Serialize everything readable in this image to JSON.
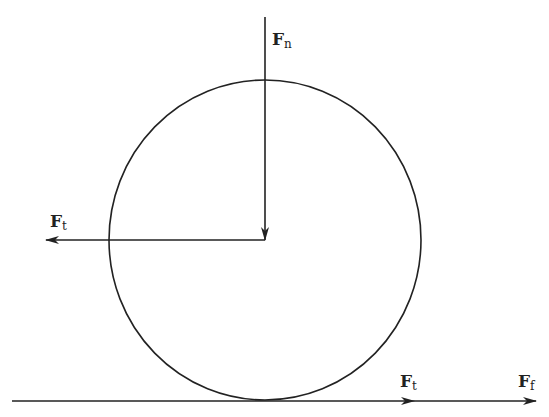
{
  "diagram": {
    "colors": {
      "stroke": "#222222",
      "background": "#ffffff"
    },
    "circle": {
      "cx": 265,
      "cy": 240,
      "rx": 156,
      "ry": 160
    },
    "ground_line": {
      "x1": 12,
      "y1": 401,
      "x2": 535,
      "y2": 401
    },
    "forces": [
      {
        "id": "Fn",
        "symbol": "F",
        "subscript": "n",
        "direction": "down",
        "from": [
          265,
          17
        ],
        "to": [
          265,
          240
        ],
        "label_pos": [
          272,
          45
        ]
      },
      {
        "id": "Ft_center",
        "symbol": "F",
        "subscript": "t",
        "direction": "left",
        "from": [
          265,
          240
        ],
        "to": [
          46,
          240
        ],
        "label_pos": [
          50,
          227
        ]
      },
      {
        "id": "Ft_ground",
        "symbol": "F",
        "subscript": "t",
        "direction": "right",
        "to": [
          415,
          401
        ],
        "label_pos": [
          400,
          387
        ]
      },
      {
        "id": "Ff_ground",
        "symbol": "F",
        "subscript": "f",
        "direction": "right",
        "to": [
          536,
          401
        ],
        "label_pos": [
          518,
          387
        ]
      }
    ]
  }
}
